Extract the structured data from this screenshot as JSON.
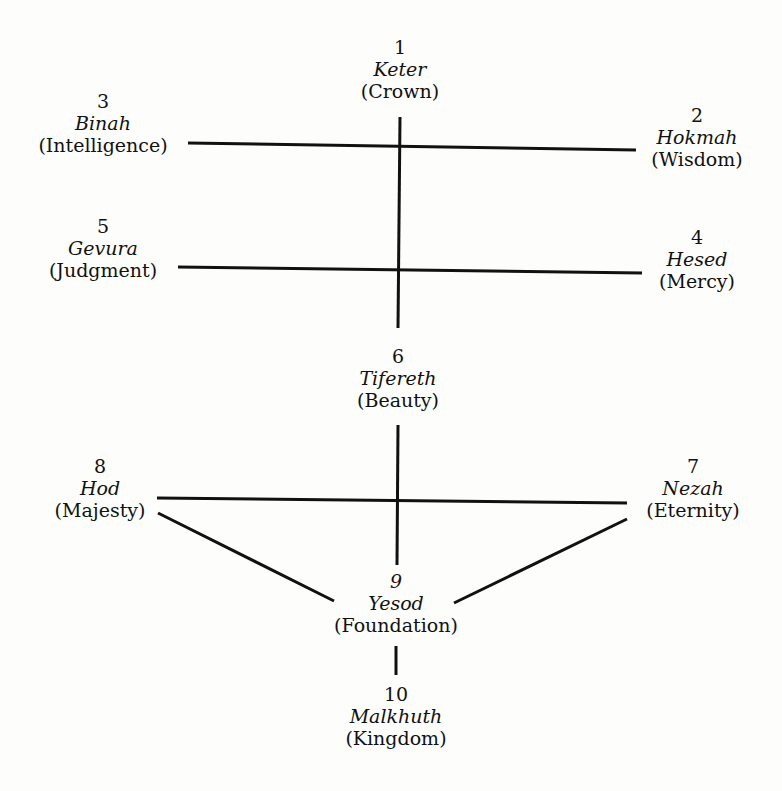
{
  "diagram": {
    "sefirot": [
      {
        "number": "1",
        "hebrew": "Keter",
        "english": "(Crown)"
      },
      {
        "number": "2",
        "hebrew": "Hokmah",
        "english": "(Wisdom)"
      },
      {
        "number": "3",
        "hebrew": "Binah",
        "english": "(Intelligence)"
      },
      {
        "number": "4",
        "hebrew": "Hesed",
        "english": "(Mercy)"
      },
      {
        "number": "5",
        "hebrew": "Gevura",
        "english": "(Judgment)"
      },
      {
        "number": "6",
        "hebrew": "Tifereth",
        "english": "(Beauty)"
      },
      {
        "number": "7",
        "hebrew": "Nezah",
        "english": "(Eternity)"
      },
      {
        "number": "8",
        "hebrew": "Hod",
        "english": "(Majesty)"
      },
      {
        "number": "9",
        "hebrew": "Yesod",
        "english": "(Foundation)"
      },
      {
        "number": "10",
        "hebrew": "Malkhuth",
        "english": "(Kingdom)"
      }
    ],
    "line_color": "#111111"
  }
}
